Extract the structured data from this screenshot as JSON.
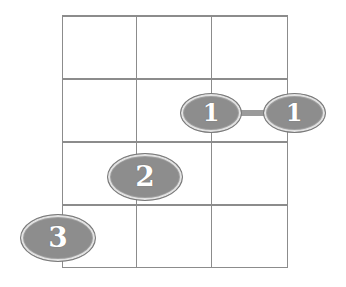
{
  "diagram": {
    "type": "ukulele-chord-fingering",
    "num_strings": 4,
    "num_frets_shown": 4,
    "colors": {
      "grid": "#8c8c8c",
      "dot_fill": "#8d8d8d",
      "dot_border": "#7a7a7a",
      "dot_inner_ring": "#e2e2e2",
      "barre": "#9a9a9a",
      "label": "#ffffff"
    },
    "fingerings": [
      {
        "finger": "1",
        "string": 3,
        "fret": 2
      },
      {
        "finger": "1",
        "string": 4,
        "fret": 2
      },
      {
        "finger": "2",
        "string": 2,
        "fret": 3
      },
      {
        "finger": "3",
        "string": 1,
        "fret": 4
      }
    ],
    "barre": {
      "finger": "1",
      "fret": 2,
      "from_string": 3,
      "to_string": 4
    },
    "dots": [
      {
        "label": "1",
        "cx": 211,
        "cy": 113,
        "w": 62,
        "h": 40,
        "font": 24
      },
      {
        "label": "1",
        "cx": 294,
        "cy": 113,
        "w": 63,
        "h": 40,
        "font": 24
      },
      {
        "label": "2",
        "cx": 145,
        "cy": 177,
        "w": 76,
        "h": 48,
        "font": 28
      },
      {
        "label": "3",
        "cx": 58,
        "cy": 238,
        "w": 76,
        "h": 48,
        "font": 28
      }
    ]
  }
}
